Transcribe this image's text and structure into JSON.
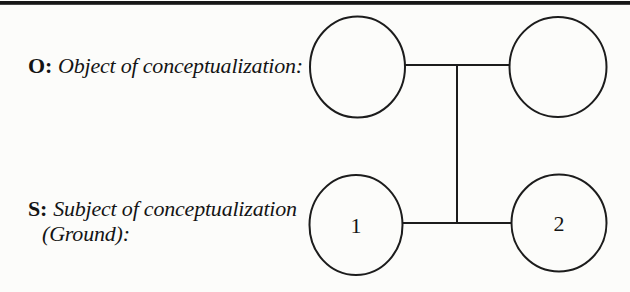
{
  "figure": {
    "background_color": "#fcfcfa",
    "ink_color": "#1c1c1c",
    "top_rule_color": "#171717"
  },
  "labels": {
    "object": {
      "prefix": "O:",
      "text": "Object of conceptualization:"
    },
    "subject": {
      "prefix": "S:",
      "line1": "Subject of conceptualization",
      "line2": "(Ground):"
    }
  },
  "diagram": {
    "nodes": {
      "subject_left": "1",
      "subject_right": "2"
    }
  }
}
